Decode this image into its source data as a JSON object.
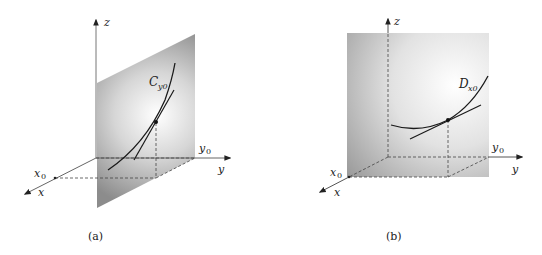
{
  "figure": {
    "panels": [
      {
        "id": "a",
        "caption": "(a)",
        "axes": {
          "x": "x",
          "y": "y",
          "z": "z"
        },
        "marks": {
          "x0": "x",
          "x0_sub": "0",
          "y0": "y",
          "y0_sub": "0"
        },
        "curve_label": "C",
        "curve_label_sub": "y0",
        "description": "Vertical plane x = const (parallel to yz? no: plane through y0 perpendicular to y-axis) containing curve C_y0 with tangent line at a point"
      },
      {
        "id": "b",
        "caption": "(b)",
        "axes": {
          "x": "x",
          "y": "y",
          "z": "z"
        },
        "marks": {
          "x0": "x",
          "x0_sub": "0",
          "y0": "y",
          "y0_sub": "0"
        },
        "curve_label": "D",
        "curve_label_sub": "x0",
        "description": "Vertical plane through x0 parallel to yz-plane containing curve D_x0 with tangent line at a point"
      }
    ],
    "colors": {
      "plane_dark": "#8a8a8a",
      "plane_light": "#ffffff",
      "axis": "#555555",
      "curve": "#1a1a1a"
    }
  }
}
